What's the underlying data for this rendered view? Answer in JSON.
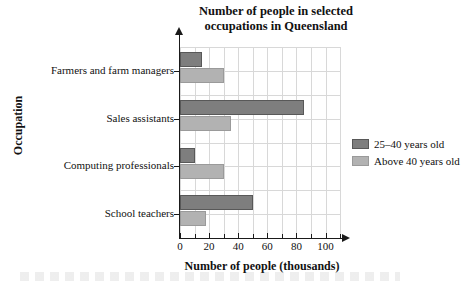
{
  "chart_data": {
    "type": "bar",
    "orientation": "horizontal",
    "title": "Number of people in selected occupations in Queensland",
    "title_line1": "Number of people in selected",
    "title_line2": "occupations in Queensland",
    "xlabel": "Number of people (thousands)",
    "ylabel": "Occupation",
    "categories": [
      "Farmers and farm managers",
      "Sales assistants",
      "Computing professionals",
      "School teachers"
    ],
    "series": [
      {
        "name": "25–40 years old",
        "color": "#7e7e7e",
        "values": [
          15,
          85,
          10,
          50
        ]
      },
      {
        "name": "Above 40 years old",
        "color": "#b2b2b2",
        "values": [
          30,
          35,
          30,
          18
        ]
      }
    ],
    "xticklabels": [
      "0",
      "20",
      "40",
      "60",
      "80",
      "100"
    ],
    "xtickvalues": [
      0,
      20,
      40,
      60,
      80,
      100
    ],
    "xlim": [
      0,
      111
    ],
    "grid": true,
    "grid_step": 10,
    "legend_position": "right"
  },
  "legend": {
    "entries": [
      {
        "label": "25–40 years old",
        "swatch": "dark"
      },
      {
        "label": "Above 40 years old",
        "swatch": "light"
      }
    ]
  }
}
